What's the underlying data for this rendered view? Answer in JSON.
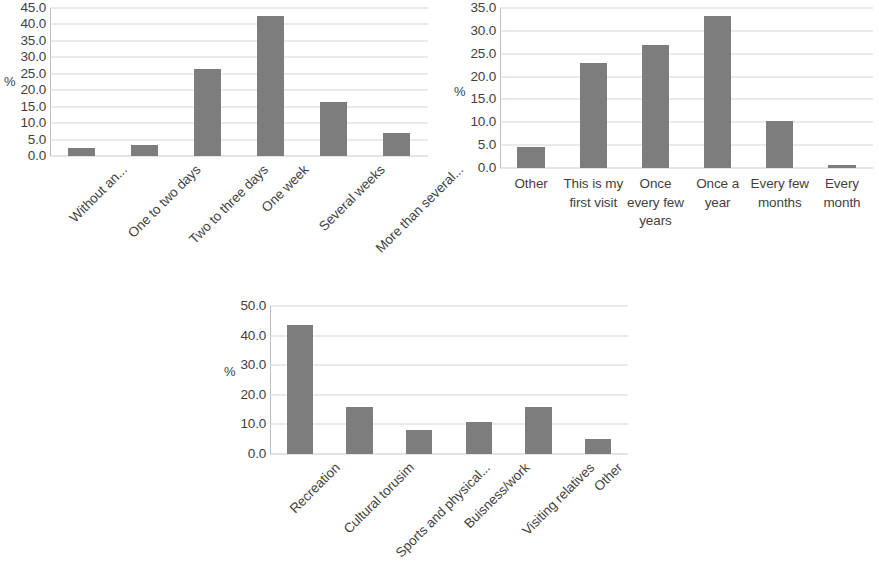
{
  "figure": {
    "background": "#ffffff",
    "bar_color": "#7d7d7d",
    "grid_color": "#d6d6d6",
    "text_color": "#3f3f3f",
    "panel_count": 3
  },
  "chart_data": [
    {
      "id": "panel-a",
      "type": "bar",
      "title": "",
      "xlabel": "",
      "ylabel": "%",
      "ylim": [
        0,
        45
      ],
      "ytick_step": 5,
      "yticks": [
        "0.0",
        "5.0",
        "10.0",
        "15.0",
        "20.0",
        "25.0",
        "30.0",
        "35.0",
        "40.0",
        "45.0"
      ],
      "ytick_values": [
        0,
        5,
        10,
        15,
        20,
        25,
        30,
        35,
        40,
        45
      ],
      "grid": true,
      "legend": "none",
      "label_rotation": -45,
      "categories": [
        "Without an...",
        "One to two days",
        "Two to three days",
        "One week",
        "Several weeks",
        "More than several..."
      ],
      "values": [
        2.5,
        3.5,
        26.5,
        42.5,
        16.5,
        7.0
      ]
    },
    {
      "id": "panel-b",
      "type": "bar",
      "title": "",
      "xlabel": "",
      "ylabel": "%",
      "ylim": [
        0,
        35
      ],
      "ytick_step": 5,
      "yticks": [
        "0.0",
        "5.0",
        "10.0",
        "15.0",
        "20.0",
        "25.0",
        "30.0",
        "35.0"
      ],
      "ytick_values": [
        0,
        5,
        10,
        15,
        20,
        25,
        30,
        35
      ],
      "grid": true,
      "legend": "none",
      "label_rotation": 0,
      "categories": [
        "Other",
        "This is my first visit",
        "Once every few years",
        "Once a year",
        "Every few months",
        "Every month"
      ],
      "values": [
        4.5,
        23.0,
        27.0,
        33.3,
        10.3,
        0.7
      ]
    },
    {
      "id": "panel-c",
      "type": "bar",
      "title": "",
      "xlabel": "",
      "ylabel": "%",
      "ylim": [
        0,
        50
      ],
      "ytick_step": 10,
      "yticks": [
        "0.0",
        "10.0",
        "20.0",
        "30.0",
        "40.0",
        "50.0"
      ],
      "ytick_values": [
        0,
        10,
        20,
        30,
        40,
        50
      ],
      "grid": true,
      "legend": "none",
      "label_rotation": -45,
      "categories": [
        "Recreation",
        "Cultural torusim",
        "Sports and physical...",
        "Buisness/work",
        "Visiting relatives",
        "Other"
      ],
      "values": [
        43.5,
        16.0,
        8.0,
        10.8,
        16.0,
        5.0
      ]
    }
  ]
}
